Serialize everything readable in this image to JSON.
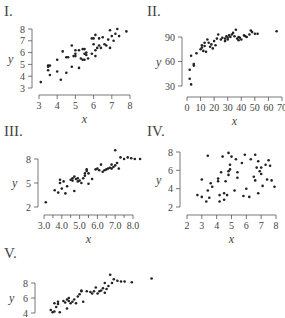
{
  "chart_data": [
    {
      "type": "scatter",
      "panel_label": "I.",
      "xlabel": "x",
      "ylabel": "y",
      "xlim": [
        3,
        8
      ],
      "ylim": [
        3,
        8
      ],
      "xticks": [
        3,
        4,
        5,
        6,
        7,
        8
      ],
      "yticks": [
        3,
        4,
        5,
        6,
        7,
        8
      ],
      "xtick_labels": [
        "3",
        "4",
        "5",
        "6",
        "7",
        "8"
      ],
      "ytick_labels": [
        "3",
        "4",
        "5",
        "6",
        "7",
        "8"
      ],
      "frame": {
        "x0": 39,
        "x1": 130,
        "y0": 88,
        "y1": 29,
        "yaxis_x": 32,
        "xaxis_y": 95,
        "label_x": 4,
        "label_y": 16
      },
      "points": [
        [
          3.1,
          3.5
        ],
        [
          3.5,
          4.9
        ],
        [
          3.5,
          4.8
        ],
        [
          3.5,
          4.5
        ],
        [
          3.6,
          4.1
        ],
        [
          3.6,
          4.9
        ],
        [
          4.0,
          4.4
        ],
        [
          4.0,
          5.4
        ],
        [
          4.2,
          3.7
        ],
        [
          4.3,
          6.1
        ],
        [
          4.5,
          5.6
        ],
        [
          4.5,
          4.3
        ],
        [
          4.6,
          5.6
        ],
        [
          4.8,
          4.8
        ],
        [
          4.8,
          6.6
        ],
        [
          4.9,
          5.7
        ],
        [
          5.0,
          6.2
        ],
        [
          5.0,
          5.7
        ],
        [
          5.0,
          5.9
        ],
        [
          5.2,
          4.7
        ],
        [
          5.2,
          6.2
        ],
        [
          5.3,
          5.5
        ],
        [
          5.4,
          5.4
        ],
        [
          5.4,
          6.3
        ],
        [
          5.5,
          5.4
        ],
        [
          5.5,
          5.9
        ],
        [
          5.5,
          6.3
        ],
        [
          5.6,
          5.8
        ],
        [
          5.6,
          6.0
        ],
        [
          5.7,
          5.5
        ],
        [
          5.9,
          5.9
        ],
        [
          5.9,
          7.2
        ],
        [
          6.0,
          6.7
        ],
        [
          6.0,
          7.2
        ],
        [
          6.1,
          5.7
        ],
        [
          6.1,
          6.2
        ],
        [
          6.1,
          7.5
        ],
        [
          6.2,
          6.4
        ],
        [
          6.3,
          6.6
        ],
        [
          6.3,
          7.2
        ],
        [
          6.4,
          6.4
        ],
        [
          6.5,
          7.3
        ],
        [
          6.6,
          6.7
        ],
        [
          6.7,
          6.6
        ],
        [
          6.8,
          7.1
        ],
        [
          6.9,
          6.4
        ],
        [
          6.9,
          7.9
        ],
        [
          7.0,
          7.4
        ],
        [
          7.1,
          7.0
        ],
        [
          7.2,
          7.6
        ],
        [
          7.3,
          8.0
        ],
        [
          7.4,
          7.4
        ],
        [
          7.8,
          7.8
        ]
      ]
    },
    {
      "type": "scatter",
      "panel_label": "II.",
      "xlabel": "x",
      "ylabel": "y",
      "xlim": [
        0,
        70
      ],
      "ylim": [
        30,
        90
      ],
      "xticks": [
        0,
        10,
        20,
        30,
        40,
        50,
        60,
        70
      ],
      "yticks": [
        30,
        60,
        90
      ],
      "xtick_labels": [
        "0",
        "10",
        "20",
        "30",
        "40",
        "50",
        "60",
        "70"
      ],
      "ytick_labels": [
        "30",
        "60",
        "90"
      ],
      "frame": {
        "x0": 187,
        "x1": 282,
        "y0": 86,
        "y1": 37,
        "yaxis_x": 182,
        "xaxis_y": 97,
        "label_x": 147,
        "label_y": 16
      },
      "points": [
        [
          2,
          39
        ],
        [
          2,
          50
        ],
        [
          3,
          32
        ],
        [
          3,
          67
        ],
        [
          5,
          57
        ],
        [
          5,
          55
        ],
        [
          7,
          70
        ],
        [
          10,
          75
        ],
        [
          11,
          80
        ],
        [
          11,
          77
        ],
        [
          12,
          73
        ],
        [
          13,
          83
        ],
        [
          13,
          79
        ],
        [
          14,
          72
        ],
        [
          15,
          87
        ],
        [
          16,
          83
        ],
        [
          17,
          78
        ],
        [
          18,
          81
        ],
        [
          19,
          76
        ],
        [
          20,
          85
        ],
        [
          21,
          80
        ],
        [
          22,
          88
        ],
        [
          23,
          93
        ],
        [
          25,
          87
        ],
        [
          26,
          89
        ],
        [
          28,
          88
        ],
        [
          28,
          85
        ],
        [
          29,
          91
        ],
        [
          30,
          89
        ],
        [
          30,
          87
        ],
        [
          31,
          92
        ],
        [
          32,
          90
        ],
        [
          33,
          93
        ],
        [
          34,
          95
        ],
        [
          35,
          91
        ],
        [
          36,
          99
        ],
        [
          37,
          88
        ],
        [
          38,
          86
        ],
        [
          38,
          90
        ],
        [
          39,
          89
        ],
        [
          40,
          87
        ],
        [
          42,
          92
        ],
        [
          43,
          91
        ],
        [
          44,
          90
        ],
        [
          46,
          93
        ],
        [
          47,
          98
        ],
        [
          48,
          96
        ],
        [
          50,
          94
        ],
        [
          52,
          94
        ],
        [
          66,
          97
        ]
      ]
    },
    {
      "type": "scatter",
      "panel_label": "III.",
      "xlabel": "x",
      "ylabel": "y",
      "xlim": [
        3.0,
        8.0
      ],
      "ylim": [
        2,
        8
      ],
      "xticks": [
        3.0,
        4.0,
        5.0,
        6.0,
        7.0,
        8.0
      ],
      "yticks": [
        2,
        5,
        8
      ],
      "xtick_labels": [
        "3.0",
        "4.0",
        "5.0",
        "6.0",
        "7.0",
        "8.0"
      ],
      "ytick_labels": [
        "2",
        "5",
        "8"
      ],
      "minor_xticks": true,
      "frame": {
        "x0": 44,
        "x1": 133,
        "y0": 207,
        "y1": 159,
        "yaxis_x": 38,
        "xaxis_y": 215,
        "label_x": 4,
        "label_y": 136
      },
      "points": [
        [
          3.1,
          2.6
        ],
        [
          3.6,
          4.1
        ],
        [
          3.8,
          3.8
        ],
        [
          3.9,
          5.0
        ],
        [
          3.9,
          5.4
        ],
        [
          4.0,
          4.3
        ],
        [
          4.1,
          5.2
        ],
        [
          4.2,
          3.7
        ],
        [
          4.3,
          4.6
        ],
        [
          4.5,
          5.4
        ],
        [
          4.6,
          5.6
        ],
        [
          4.6,
          5.3
        ],
        [
          4.7,
          4.0
        ],
        [
          4.7,
          5.8
        ],
        [
          4.8,
          5.5
        ],
        [
          4.9,
          5.2
        ],
        [
          4.9,
          5.6
        ],
        [
          5.0,
          5.3
        ],
        [
          5.1,
          5.0
        ],
        [
          5.2,
          5.6
        ],
        [
          5.3,
          6.2
        ],
        [
          5.3,
          5.9
        ],
        [
          5.4,
          6.7
        ],
        [
          5.4,
          6.5
        ],
        [
          5.5,
          4.9
        ],
        [
          5.5,
          6.2
        ],
        [
          5.7,
          5.5
        ],
        [
          5.9,
          6.7
        ],
        [
          6.0,
          6.8
        ],
        [
          6.1,
          6.6
        ],
        [
          6.2,
          7.3
        ],
        [
          6.3,
          6.4
        ],
        [
          6.4,
          6.6
        ],
        [
          6.5,
          6.7
        ],
        [
          6.6,
          6.8
        ],
        [
          6.7,
          6.9
        ],
        [
          6.8,
          7.3
        ],
        [
          6.8,
          6.8
        ],
        [
          6.9,
          7.0
        ],
        [
          7.0,
          7.2
        ],
        [
          7.1,
          7.5
        ],
        [
          7.2,
          6.8
        ],
        [
          7.0,
          9.1
        ],
        [
          7.3,
          8.2
        ],
        [
          7.5,
          8.0
        ],
        [
          7.7,
          8.2
        ],
        [
          7.9,
          8.1
        ],
        [
          8.1,
          8.0
        ],
        [
          8.4,
          8.0
        ]
      ]
    },
    {
      "type": "scatter",
      "panel_label": "IV.",
      "xlabel": "x",
      "ylabel": "y",
      "xlim": [
        2,
        8
      ],
      "ylim": [
        2,
        8
      ],
      "xticks": [
        2,
        3,
        4,
        5,
        6,
        7,
        8
      ],
      "yticks": [
        2,
        4,
        6,
        8
      ],
      "xtick_labels": [
        "2",
        "3",
        "4",
        "5",
        "6",
        "7",
        "8"
      ],
      "ytick_labels": [
        "2",
        "4",
        "6",
        "8"
      ],
      "frame": {
        "x0": 187,
        "x1": 276,
        "y0": 207,
        "y1": 152,
        "yaxis_x": 180,
        "xaxis_y": 215,
        "label_x": 147,
        "label_y": 136
      },
      "points": [
        [
          2.7,
          3.3
        ],
        [
          3.0,
          5.0
        ],
        [
          3.0,
          3.1
        ],
        [
          3.3,
          2.6
        ],
        [
          3.4,
          7.6
        ],
        [
          3.4,
          3.8
        ],
        [
          3.5,
          3.0
        ],
        [
          3.6,
          4.6
        ],
        [
          3.7,
          4.2
        ],
        [
          4.1,
          5.1
        ],
        [
          4.1,
          4.8
        ],
        [
          4.2,
          3.3
        ],
        [
          4.2,
          2.6
        ],
        [
          4.3,
          5.8
        ],
        [
          4.4,
          7.5
        ],
        [
          4.5,
          3.5
        ],
        [
          4.5,
          2.8
        ],
        [
          4.6,
          4.8
        ],
        [
          4.7,
          3.3
        ],
        [
          4.8,
          5.9
        ],
        [
          4.8,
          5.5
        ],
        [
          4.8,
          7.9
        ],
        [
          4.9,
          6.1
        ],
        [
          4.9,
          6.6
        ],
        [
          5.0,
          7.5
        ],
        [
          5.2,
          3.8
        ],
        [
          5.3,
          7.2
        ],
        [
          5.4,
          5.8
        ],
        [
          5.4,
          5.2
        ],
        [
          5.7,
          6.8
        ],
        [
          5.8,
          3.2
        ],
        [
          5.9,
          7.7
        ],
        [
          6.0,
          4.0
        ],
        [
          6.2,
          3.1
        ],
        [
          6.3,
          7.2
        ],
        [
          6.5,
          5.3
        ],
        [
          6.6,
          7.7
        ],
        [
          6.6,
          4.9
        ],
        [
          6.7,
          6.3
        ],
        [
          6.8,
          7.0
        ],
        [
          6.8,
          3.5
        ],
        [
          6.9,
          5.9
        ],
        [
          7.0,
          6.3
        ],
        [
          7.0,
          5.6
        ],
        [
          7.1,
          4.3
        ],
        [
          7.3,
          6.6
        ],
        [
          7.4,
          5.0
        ],
        [
          7.5,
          7.1
        ],
        [
          7.6,
          6.5
        ],
        [
          7.7,
          4.9
        ],
        [
          7.9,
          4.2
        ]
      ]
    },
    {
      "type": "scatter",
      "panel_label": "V.",
      "xlabel": "",
      "ylabel": "y",
      "ylim": [
        4,
        8
      ],
      "yticks": [
        4,
        6,
        8
      ],
      "ytick_labels": [
        "4",
        "6",
        "8"
      ],
      "xlim": [
        3.0,
        8.0
      ],
      "frame": {
        "x0": 40,
        "x1": 130,
        "y0": 313,
        "y1": 283,
        "yaxis_x": 35,
        "xaxis_y": 330,
        "label_x": 4,
        "label_y": 258
      },
      "points": [
        [
          3.6,
          4.4
        ],
        [
          3.7,
          4.1
        ],
        [
          3.8,
          5.3
        ],
        [
          3.8,
          4.2
        ],
        [
          3.9,
          4.8
        ],
        [
          4.0,
          5.5
        ],
        [
          4.0,
          5.2
        ],
        [
          4.1,
          4.1
        ],
        [
          4.3,
          5.6
        ],
        [
          4.4,
          5.4
        ],
        [
          4.5,
          5.8
        ],
        [
          4.5,
          4.6
        ],
        [
          4.6,
          6.0
        ],
        [
          4.6,
          5.6
        ],
        [
          4.7,
          5.3
        ],
        [
          4.8,
          5.5
        ],
        [
          4.9,
          5.8
        ],
        [
          5.0,
          5.3
        ],
        [
          5.1,
          6.2
        ],
        [
          5.2,
          6.5
        ],
        [
          5.3,
          7.0
        ],
        [
          5.3,
          6.9
        ],
        [
          5.4,
          5.5
        ],
        [
          5.6,
          6.9
        ],
        [
          5.8,
          6.8
        ],
        [
          5.9,
          6.6
        ],
        [
          6.0,
          6.9
        ],
        [
          6.1,
          7.4
        ],
        [
          6.2,
          6.6
        ],
        [
          6.3,
          6.9
        ],
        [
          6.4,
          7.0
        ],
        [
          6.5,
          7.3
        ],
        [
          6.6,
          6.7
        ],
        [
          6.6,
          8.0
        ],
        [
          6.7,
          7.2
        ],
        [
          6.8,
          7.6
        ],
        [
          6.9,
          9.1
        ],
        [
          7.0,
          8.0
        ],
        [
          7.1,
          8.5
        ],
        [
          7.3,
          8.3
        ],
        [
          7.5,
          8.2
        ],
        [
          7.7,
          8.2
        ],
        [
          8.1,
          8.1
        ],
        [
          9.2,
          8.6
        ]
      ]
    }
  ]
}
